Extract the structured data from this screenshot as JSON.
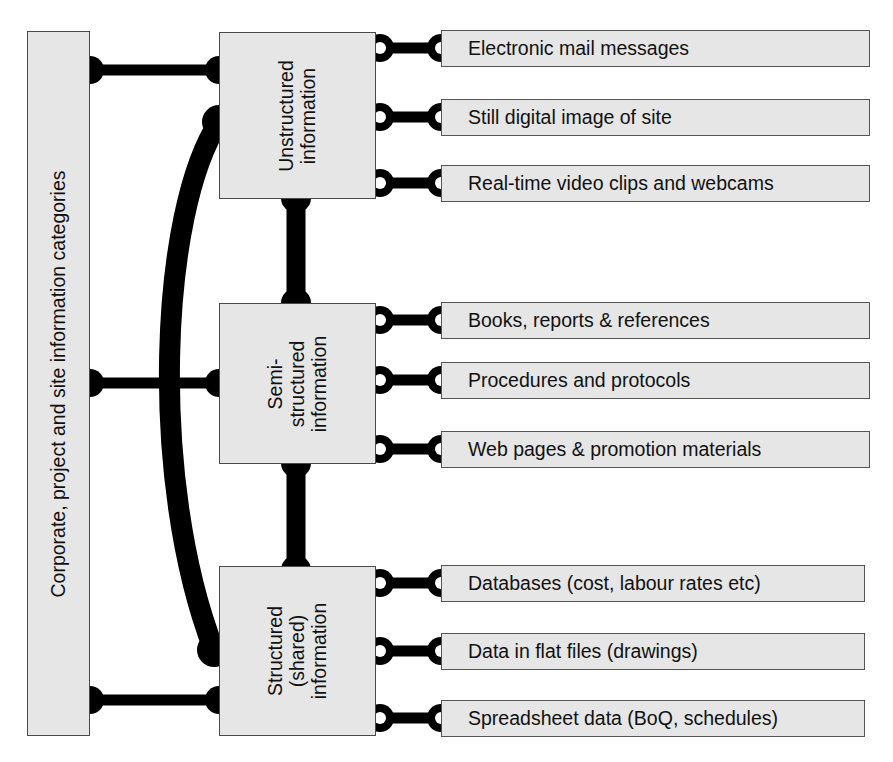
{
  "diagram": {
    "title": "Corporate, project and site information categories",
    "spine": {
      "label": "Corporate, project and site information categories"
    },
    "categories": [
      {
        "id": "unstructured",
        "label": "Unstructured\ninformation",
        "label_lines": [
          "Unstructured",
          "information"
        ],
        "items": [
          "Electronic mail messages",
          "Still digital image of site",
          "Real-time video clips and webcams"
        ]
      },
      {
        "id": "semi-structured",
        "label": "Semi-\nstructured\ninformation",
        "label_lines": [
          "Semi-",
          "structured",
          "information"
        ],
        "items": [
          "Books, reports & references",
          "Procedures and protocols",
          "Web pages & promotion materials"
        ]
      },
      {
        "id": "structured-shared",
        "label": "Structured\n(shared)\ninformation",
        "label_lines": [
          "Structured",
          "(shared)",
          "information"
        ],
        "items": [
          "Databases (cost, labour rates etc)",
          "Data in flat files (drawings)",
          "Spreadsheet data  (BoQ, schedules)"
        ]
      }
    ],
    "colors": {
      "box_fill": "#e6e6e6",
      "box_stroke": "#4a4a4a",
      "connector": "#000000",
      "text": "#111111",
      "background": "#ffffff"
    },
    "connectors": {
      "spine_to_category": "solid-dumbbell",
      "category_to_category": "thick-vertical-dumbbell",
      "category_to_item": "ring-dumbbell",
      "arc": "thick-curved-arc"
    }
  }
}
